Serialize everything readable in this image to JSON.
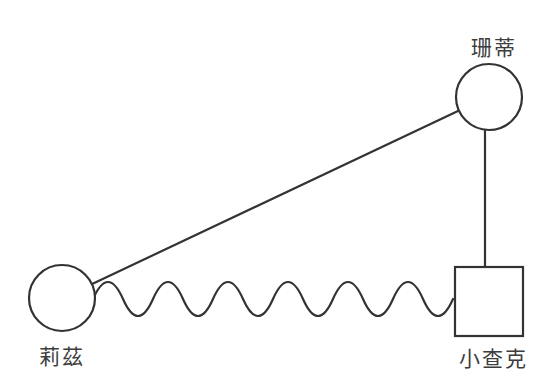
{
  "figure": {
    "type": "relationship-diagram",
    "background_color": "#ffffff",
    "stroke_color": "#333333",
    "label_color": "#3d3d3d"
  },
  "nodes": {
    "sandy": {
      "label": "珊蒂",
      "shape": "circle",
      "position": "top-right"
    },
    "liz": {
      "label": "莉茲",
      "shape": "circle",
      "position": "bottom-left"
    },
    "little_chuck": {
      "label": "小查克",
      "shape": "square",
      "position": "bottom-right"
    }
  },
  "edges": [
    {
      "from": "liz",
      "to": "sandy",
      "style": "straight"
    },
    {
      "from": "sandy",
      "to": "little_chuck",
      "style": "straight"
    },
    {
      "from": "liz",
      "to": "little_chuck",
      "style": "wavy"
    }
  ]
}
